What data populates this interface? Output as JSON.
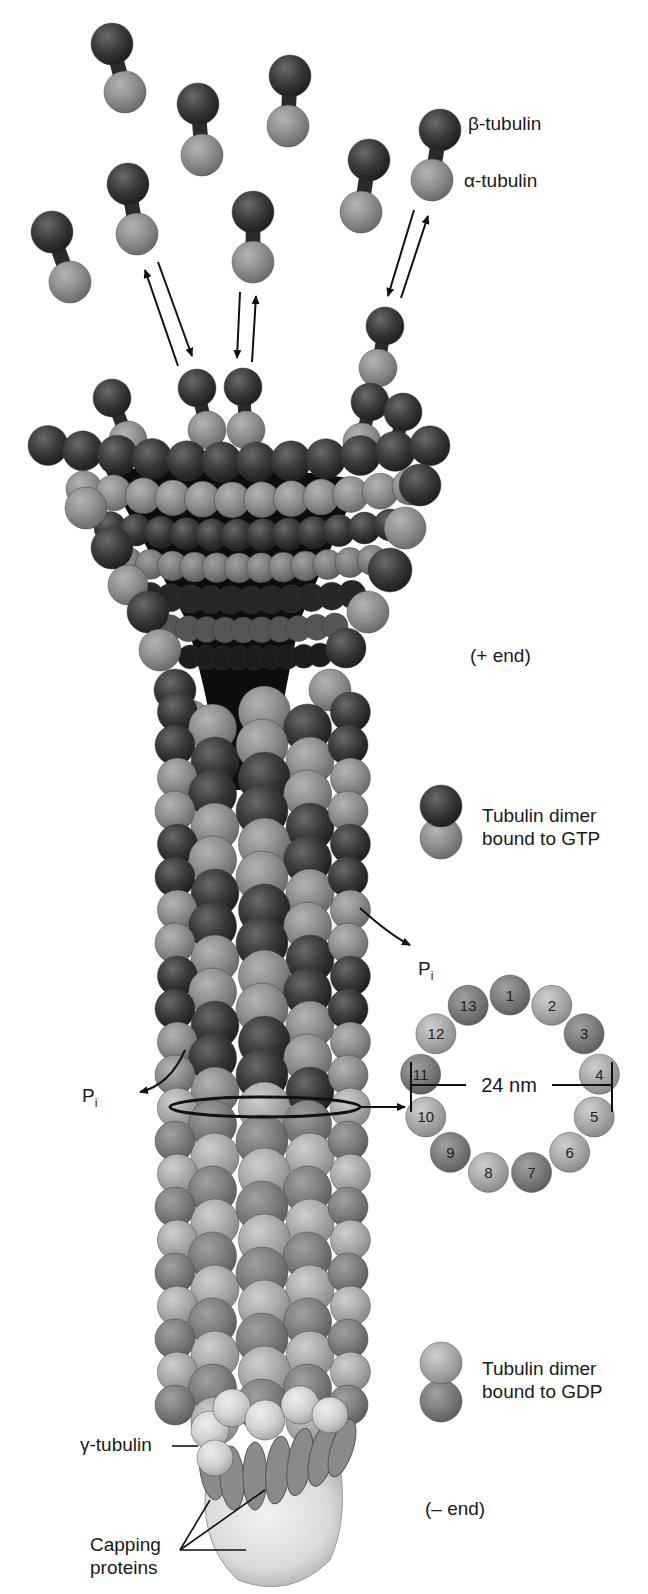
{
  "diagram": {
    "colors": {
      "beta_tubulin_gtp": "#3a3a3a",
      "alpha_tubulin_gtp": "#8c8c8c",
      "tubulin_gdp_light": "#a8a8a8",
      "tubulin_gdp_dark": "#7c7c7c",
      "gamma_tubulin": "#d4d4d4",
      "capping_protein": "#888888",
      "cap_body": "#e0e0e0",
      "lumen": "#0d0d0d"
    },
    "labels": {
      "beta_tubulin": "β-tubulin",
      "alpha_tubulin": "α-tubulin",
      "plus_end": "(+ end)",
      "minus_end": "(– end)",
      "gtp_dimer_line1": "Tubulin dimer",
      "gtp_dimer_line2": "bound to GTP",
      "gdp_dimer_line1": "Tubulin dimer",
      "gdp_dimer_line2": "bound to GDP",
      "pi_right": "P",
      "pi_right_sub": "i",
      "pi_left": "P",
      "pi_left_sub": "i",
      "diameter": "24 nm",
      "gamma_tubulin": "γ-tubulin",
      "capping_line1": "Capping",
      "capping_line2": "proteins"
    },
    "cross_section": {
      "protofilament_count": 13,
      "protofilaments": [
        "1",
        "2",
        "3",
        "4",
        "5",
        "6",
        "7",
        "8",
        "9",
        "10",
        "11",
        "12",
        "13"
      ]
    }
  }
}
